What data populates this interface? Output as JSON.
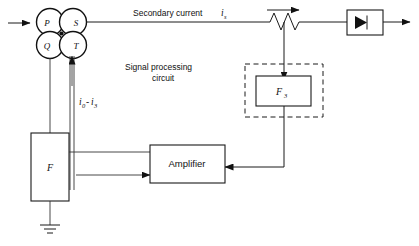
{
  "diagram": {
    "background_color": "#ffffff",
    "line_color": "#1a1a1a",
    "nodes": {
      "p": "P",
      "s": "S",
      "q": "Q",
      "t": "T"
    },
    "labels": {
      "secondary_current": "Secondary current",
      "secondary_current_symbol": "i",
      "secondary_current_subscript": "s",
      "signal_processing_line1": "Signal processing",
      "signal_processing_line2": "circuit",
      "sensor_currents_symbol_1": "i",
      "sensor_currents_subscript_1": "0",
      "sensor_currents_dash": "-",
      "sensor_currents_symbol_2": "i",
      "sensor_currents_subscript_2": "3",
      "filter_box": "F",
      "f3_box_symbol": "F",
      "f3_box_subscript": "3",
      "amplifier_box": "Amplifier"
    },
    "symbols": {
      "variable_resistor": "variable-resistor-symbol",
      "diode": "diode-symbol",
      "ground": "ground-symbol"
    }
  }
}
